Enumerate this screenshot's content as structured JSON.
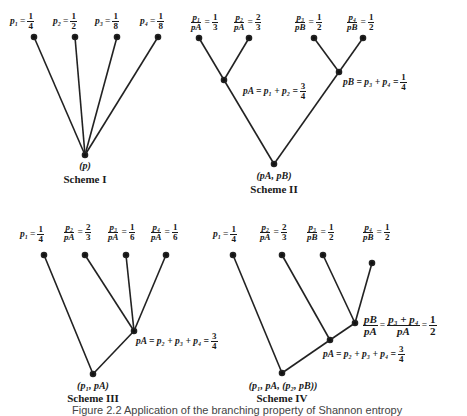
{
  "schemes": [
    {
      "title": "Scheme I",
      "root_label": "(p)",
      "leaf_labels": [
        {
          "lhs": "p₁",
          "num": "1",
          "den": "4"
        },
        {
          "lhs": "p₂",
          "num": "1",
          "den": "2"
        },
        {
          "lhs": "p₃",
          "num": "1",
          "den": "8"
        },
        {
          "lhs": "p₄",
          "num": "1",
          "den": "8"
        }
      ]
    },
    {
      "title": "Scheme II",
      "root_label": "(pA, pB)",
      "leaf_labels": [
        {
          "lnum": "p₁",
          "lden": "pA",
          "num": "1",
          "den": "3"
        },
        {
          "lnum": "p₂",
          "lden": "pA",
          "num": "2",
          "den": "3"
        },
        {
          "lnum": "p₃",
          "lden": "pB",
          "num": "1",
          "den": "2"
        },
        {
          "lnum": "p₄",
          "lden": "pB",
          "num": "1",
          "den": "2"
        }
      ],
      "internal_labels": [
        {
          "text": "pA = p₁ + p₂ =",
          "num": "3",
          "den": "4"
        },
        {
          "text": "pB = p₃ + p₄ =",
          "num": "1",
          "den": "4"
        }
      ]
    },
    {
      "title": "Scheme III",
      "root_label": "(p₁, pA)",
      "leaf_labels": [
        {
          "lhs": "p₁",
          "num": "1",
          "den": "4"
        },
        {
          "lnum": "p₂",
          "lden": "pA",
          "num": "2",
          "den": "3"
        },
        {
          "lnum": "p₃",
          "lden": "pA",
          "num": "1",
          "den": "6"
        },
        {
          "lnum": "p₄",
          "lden": "pA",
          "num": "1",
          "den": "6"
        }
      ],
      "internal_labels": [
        {
          "text": "pA = p₂ + p₃ + p₄ =",
          "num": "3",
          "den": "4"
        }
      ]
    },
    {
      "title": "Scheme IV",
      "root_label": "(p₁, pA, (p₂, pB))",
      "leaf_labels": [
        {
          "lhs": "p₁",
          "num": "1",
          "den": "4"
        },
        {
          "lnum": "p₂",
          "lden": "pA",
          "num": "2",
          "den": "3"
        },
        {
          "lnum": "p₃",
          "lden": "pB",
          "num": "1",
          "den": "2"
        },
        {
          "lnum": "p₄",
          "lden": "pB",
          "num": "1",
          "den": "2"
        }
      ],
      "internal_labels": [
        {
          "lnum": "pB",
          "lden": "pA",
          "mnum": "p₃ + p₄",
          "mden": "pA",
          "num": "1",
          "den": "2"
        },
        {
          "text": "pA = p₂ + p₃ + p₄ =",
          "num": "3",
          "den": "4"
        }
      ]
    }
  ],
  "caption": "Figure 2.2  Application of the branching property of Shannon entropy"
}
